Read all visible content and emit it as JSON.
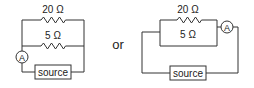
{
  "diagram": {
    "type": "circuit-comparison",
    "connector_label": "or",
    "circuits": [
      {
        "id": "left",
        "components": [
          {
            "kind": "resistor",
            "label": "20 Ω"
          },
          {
            "kind": "resistor",
            "label": "5 Ω"
          },
          {
            "kind": "ammeter",
            "label": "A"
          },
          {
            "kind": "source",
            "label": "source"
          }
        ]
      },
      {
        "id": "right",
        "components": [
          {
            "kind": "resistor",
            "label": "20 Ω"
          },
          {
            "kind": "resistor",
            "label": "5 Ω"
          },
          {
            "kind": "ammeter",
            "label": "A"
          },
          {
            "kind": "source",
            "label": "source"
          }
        ]
      }
    ],
    "colors": {
      "line": "#333333",
      "text": "#222222",
      "background": "#ffffff"
    }
  }
}
